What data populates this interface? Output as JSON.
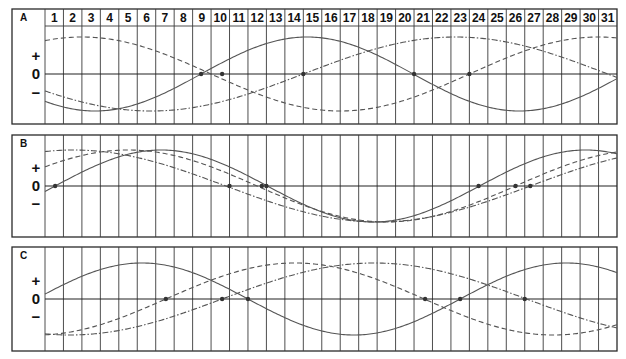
{
  "chart_data": {
    "type": "line",
    "title": "",
    "xlabel": "",
    "ylabel": "",
    "days": [
      1,
      2,
      3,
      4,
      5,
      6,
      7,
      8,
      9,
      10,
      11,
      12,
      13,
      14,
      15,
      16,
      17,
      18,
      19,
      20,
      21,
      22,
      23,
      24,
      25,
      26,
      27,
      28,
      29,
      30,
      31
    ],
    "y_labels": {
      "plus": "+",
      "zero": "0",
      "minus": "−"
    },
    "ylim": [
      -1,
      1
    ],
    "grid": true,
    "legend": "none",
    "panels": [
      {
        "label": "A",
        "series": [
          {
            "name": "solid",
            "style": "solid",
            "period_days": 23,
            "ascending_zero_day": 8.46,
            "zero_markers": [
              8.46,
              20.0
            ]
          },
          {
            "name": "dashed",
            "style": "dashed",
            "period_days": 28,
            "ascending_zero_day": 23.0,
            "zero_markers": [
              9.6,
              23.0
            ]
          },
          {
            "name": "dash-dot",
            "style": "dash-dot",
            "period_days": 33,
            "ascending_zero_day": 14.0,
            "zero_markers": [
              14.0
            ]
          }
        ]
      },
      {
        "label": "B",
        "series": [
          {
            "name": "solid",
            "style": "solid",
            "period_days": 23,
            "ascending_zero_day": 0.55,
            "zero_markers": [
              0.55,
              12.0,
              23.5
            ]
          },
          {
            "name": "dashed",
            "style": "dashed",
            "period_days": 28,
            "ascending_zero_day": 25.5,
            "zero_markers": [
              11.75,
              25.5
            ]
          },
          {
            "name": "dash-dot",
            "style": "dash-dot",
            "period_days": 33,
            "ascending_zero_day": 26.3,
            "zero_markers": [
              10.0,
              26.3
            ]
          }
        ]
      },
      {
        "label": "C",
        "series": [
          {
            "name": "solid",
            "style": "solid",
            "period_days": 23,
            "ascending_zero_day": -0.5,
            "zero_markers": [
              11.0,
              22.5
            ]
          },
          {
            "name": "dashed",
            "style": "dashed",
            "period_days": 28,
            "ascending_zero_day": 6.55,
            "zero_markers": [
              6.55,
              20.6
            ]
          },
          {
            "name": "dash-dot",
            "style": "dash-dot",
            "period_days": 33,
            "ascending_zero_day": 9.6,
            "zero_markers": [
              9.6,
              26.0
            ]
          }
        ]
      }
    ]
  }
}
